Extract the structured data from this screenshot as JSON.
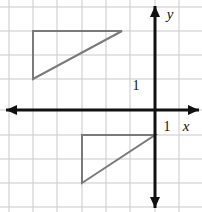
{
  "figure": {
    "width": 202,
    "height": 212,
    "background_color": "#ffffff"
  },
  "grid": {
    "color": "#c9c9c9",
    "spacing_px": 24,
    "origin_px": {
      "x": 155,
      "y": 110
    },
    "vertical_lines_px": [
      9,
      33,
      57,
      82,
      106,
      130,
      155,
      179
    ],
    "horizontal_lines_px": [
      7,
      31,
      55,
      79,
      110,
      135,
      159,
      183,
      207
    ],
    "visible": true
  },
  "axes": {
    "color": "#111111",
    "x_axis": {
      "label": "x",
      "label_pos_px": {
        "x": 186,
        "y": 131
      },
      "y_px": 110,
      "start_px": 6,
      "end_px": 199,
      "arrow_left": true,
      "arrow_right": true
    },
    "y_axis": {
      "label": "y",
      "label_pos_px": {
        "x": 170,
        "y": 19
      },
      "x_px": 155,
      "start_px": 6,
      "end_px": 208,
      "arrow_up": true,
      "arrow_down": true
    },
    "ticks": [
      {
        "name": "y-unit-tick",
        "label": "1",
        "label_pos_px": {
          "x": 136,
          "y": 90
        }
      },
      {
        "name": "x-unit-tick",
        "label": "1",
        "label_pos_px": {
          "x": 167,
          "y": 131
        }
      }
    ]
  },
  "shapes": {
    "stroke_color": "#7a7a7a",
    "stroke_width": 2,
    "fill": "none",
    "triangles": [
      {
        "name": "upper-triangle",
        "quadrant": "II",
        "points_px": "33,31 122,31 33,79",
        "vertices_units": [
          {
            "x": -5,
            "y": 3
          },
          {
            "x": -1.4,
            "y": 3
          },
          {
            "x": -5,
            "y": 1
          }
        ]
      },
      {
        "name": "lower-triangle",
        "quadrant": "III",
        "points_px": "82,135 155,135 82,183",
        "vertices_units": [
          {
            "x": -3,
            "y": -1
          },
          {
            "x": 0,
            "y": -1
          },
          {
            "x": -3,
            "y": -3
          }
        ]
      }
    ]
  }
}
